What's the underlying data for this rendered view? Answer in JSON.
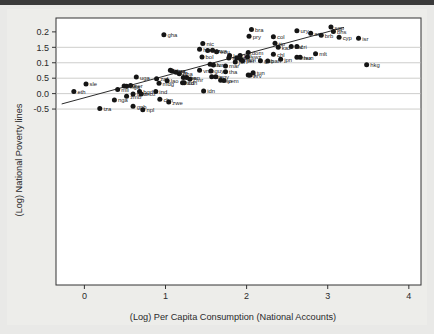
{
  "chart_data": {
    "type": "scatter",
    "title": "",
    "xlabel": "(Log) Per Capita Consumption (National Accounts)",
    "ylabel": "(Log) National Poverty lines",
    "xlim": [
      -0.35,
      4.15
    ],
    "ylim": [
      -0.62,
      0.245
    ],
    "xticks": [
      "0",
      "1",
      "2",
      "3",
      "4"
    ],
    "xtick_values": [
      0,
      1,
      2,
      3,
      4
    ],
    "yticks": [
      "0.2",
      "1.5",
      "0.1",
      "0.5",
      "0.0",
      "-0.5"
    ],
    "ytick_values": [
      0.2,
      0.15,
      0.1,
      0.05,
      0.0,
      -0.05
    ],
    "grid": "horizontal",
    "legend": "none",
    "fit_line": {
      "label": "linear fit",
      "x1": -0.28,
      "y1": -0.0335,
      "x2": 3.2,
      "y2": 0.2145
    },
    "points": [
      {
        "label": "sgp",
        "x": 3.04,
        "y": 0.2155
      },
      {
        "label": "bra",
        "x": 2.06,
        "y": 0.2075
      },
      {
        "label": "ury",
        "x": 2.62,
        "y": 0.2035
      },
      {
        "label": "bhs",
        "x": 3.07,
        "y": 0.2015
      },
      {
        "label": "arg",
        "x": 2.79,
        "y": 0.1955
      },
      {
        "label": "gha",
        "x": 0.98,
        "y": 0.1905
      },
      {
        "label": "brb",
        "x": 2.92,
        "y": 0.1895
      },
      {
        "label": "pry",
        "x": 2.03,
        "y": 0.1855
      },
      {
        "label": "col",
        "x": 2.33,
        "y": 0.1845
      },
      {
        "label": "cyp",
        "x": 3.14,
        "y": 0.1825
      },
      {
        "label": "isr",
        "x": 3.38,
        "y": 0.1795
      },
      {
        "label": "tto",
        "x": 2.35,
        "y": 0.1635
      },
      {
        "label": "nic",
        "x": 1.46,
        "y": 0.1625
      },
      {
        "label": "cri",
        "x": 2.62,
        "y": 0.1525
      },
      {
        "label": "zaf",
        "x": 2.55,
        "y": 0.1525
      },
      {
        "label": "kaz",
        "x": 2.39,
        "y": 0.1505
      },
      {
        "label": "hnd",
        "x": 1.42,
        "y": 0.1435
      },
      {
        "label": "bwa",
        "x": 1.58,
        "y": 0.1405
      },
      {
        "label": "kgz",
        "x": 1.52,
        "y": 0.1395
      },
      {
        "label": "ecu",
        "x": 1.63,
        "y": 0.1355
      },
      {
        "label": "dom",
        "x": 2.02,
        "y": 0.1335
      },
      {
        "label": "mlt",
        "x": 2.85,
        "y": 0.1295
      },
      {
        "label": "chl",
        "x": 2.33,
        "y": 0.1275
      },
      {
        "label": "lso",
        "x": 1.79,
        "y": 0.1235
      },
      {
        "label": "phl",
        "x": 1.92,
        "y": 0.1235
      },
      {
        "label": "bol",
        "x": 1.45,
        "y": 0.1185
      },
      {
        "label": "mex",
        "x": 2.62,
        "y": 0.1175
      },
      {
        "label": "hun",
        "x": 2.66,
        "y": 0.1175
      },
      {
        "label": "swz",
        "x": 2.01,
        "y": 0.1185
      },
      {
        "label": "syr",
        "x": 1.78,
        "y": 0.1155
      },
      {
        "label": "gtm",
        "x": 1.88,
        "y": 0.1155
      },
      {
        "label": "jpn",
        "x": 2.42,
        "y": 0.1115
      },
      {
        "label": "nam",
        "x": 1.93,
        "y": 0.1105
      },
      {
        "label": "per",
        "x": 1.95,
        "y": 0.1065
      },
      {
        "label": "gab",
        "x": 2.17,
        "y": 0.1065
      },
      {
        "label": "pan",
        "x": 2.26,
        "y": 0.1055
      },
      {
        "label": "jor",
        "x": 1.86,
        "y": 0.1025
      },
      {
        "label": "hkg",
        "x": 3.48,
        "y": 0.0935
      },
      {
        "label": "slv",
        "x": 1.55,
        "y": 0.0955
      },
      {
        "label": "tur",
        "x": 1.59,
        "y": 0.0925
      },
      {
        "label": "mar",
        "x": 1.74,
        "y": 0.0895
      },
      {
        "label": "khm",
        "x": 1.06,
        "y": 0.0755
      },
      {
        "label": "vnm",
        "x": 1.42,
        "y": 0.0755
      },
      {
        "label": "guy",
        "x": 1.56,
        "y": 0.0735
      },
      {
        "label": "nga2",
        "x": 1.08,
        "y": 0.0735
      },
      {
        "label": "tha",
        "x": 1.74,
        "y": 0.0705
      },
      {
        "label": "idn2",
        "x": 1.13,
        "y": 0.0695
      },
      {
        "label": "tun",
        "x": 2.08,
        "y": 0.0675
      },
      {
        "label": "gha2",
        "x": 1.17,
        "y": 0.0645
      },
      {
        "label": "fji",
        "x": 2.02,
        "y": 0.0605
      },
      {
        "label": "hrv",
        "x": 2.04,
        "y": 0.0595
      },
      {
        "label": "egy",
        "x": 1.62,
        "y": 0.0545
      },
      {
        "label": "civ",
        "x": 1.57,
        "y": 0.0545
      },
      {
        "label": "uga",
        "x": 0.64,
        "y": 0.0535
      },
      {
        "label": "sen",
        "x": 1.22,
        "y": 0.0525
      },
      {
        "label": "ben",
        "x": 1.26,
        "y": 0.0525
      },
      {
        "label": "cmr",
        "x": 1.3,
        "y": 0.0465
      },
      {
        "label": "zaf2",
        "x": 0.89,
        "y": 0.0485
      },
      {
        "label": "lso2",
        "x": 1.68,
        "y": 0.0435
      },
      {
        "label": "yem",
        "x": 1.72,
        "y": 0.0425
      },
      {
        "label": "lao",
        "x": 1.02,
        "y": 0.0415
      },
      {
        "label": "sdn",
        "x": 1.23,
        "y": 0.0355
      },
      {
        "label": "tcd",
        "x": 1.21,
        "y": 0.0355
      },
      {
        "label": "mdg",
        "x": 0.92,
        "y": 0.0335
      },
      {
        "label": "sle",
        "x": 0.02,
        "y": 0.0315
      },
      {
        "label": "ner",
        "x": 0.57,
        "y": 0.0265
      },
      {
        "label": "bfa",
        "x": 0.49,
        "y": 0.0245
      },
      {
        "label": "nga3",
        "x": 0.52,
        "y": 0.0235
      },
      {
        "label": "mli",
        "x": 0.41,
        "y": 0.0135
      },
      {
        "label": "eth",
        "x": -0.13,
        "y": 0.0065
      },
      {
        "label": "idn",
        "x": 1.47,
        "y": 0.0085
      },
      {
        "label": "bgd",
        "x": 0.68,
        "y": 0.0065
      },
      {
        "label": "ind",
        "x": 0.88,
        "y": 0.0065
      },
      {
        "label": "mwi",
        "x": 0.6,
        "y": -0.0015
      },
      {
        "label": "moz",
        "x": 0.7,
        "y": -0.0015
      },
      {
        "label": "zmb",
        "x": 0.52,
        "y": -0.0085
      },
      {
        "label": "chn",
        "x": 0.93,
        "y": -0.0185
      },
      {
        "label": "nga",
        "x": 0.37,
        "y": -0.0205
      },
      {
        "label": "zwe",
        "x": 1.04,
        "y": -0.0275
      },
      {
        "label": "gnb",
        "x": 0.6,
        "y": -0.0405
      },
      {
        "label": "tza",
        "x": 0.19,
        "y": -0.0485
      },
      {
        "label": "npl",
        "x": 0.72,
        "y": -0.0525
      }
    ],
    "visible_point_labels": [
      "sgp",
      "bra",
      "ury",
      "bhs",
      "arg",
      "gha",
      "brb",
      "pry",
      "col",
      "cyp",
      "isr",
      "tto",
      "nic",
      "cri",
      "zaf",
      "kaz",
      "hnd",
      "bwa",
      "kgz",
      "ecu",
      "dom",
      "mlt",
      "chl",
      "lso",
      "phl",
      "bol",
      "mex",
      "hun",
      "swz",
      "syr",
      "gtm",
      "jpn",
      "nam",
      "per",
      "gab",
      "pan",
      "jor",
      "hkg",
      "slv",
      "tur",
      "mar",
      "khm",
      "vnm",
      "guy",
      "tha",
      "tun",
      "fji",
      "hrv",
      "egy",
      "civ",
      "uga",
      "sen",
      "ben",
      "cmr",
      "yem",
      "lao",
      "sdn",
      "tcd",
      "mdg",
      "sle",
      "ner",
      "bfa",
      "mli",
      "eth",
      "idn",
      "bgd",
      "ind",
      "mwi",
      "moz",
      "zmb",
      "chn",
      "nga",
      "zwe",
      "gnb",
      "tza",
      "npl"
    ]
  },
  "colors": {
    "page_background": "#e9e9e7",
    "plot_background": "#ffffff",
    "point": "#151515",
    "gridline": "#b9b9b6",
    "axis": "#333333",
    "text": "#2a2a2a",
    "top_bar": "#3a3a3a"
  }
}
